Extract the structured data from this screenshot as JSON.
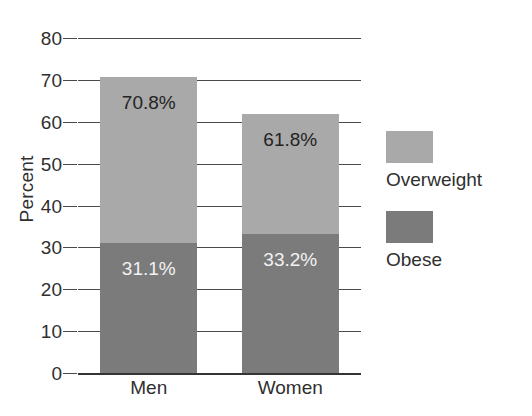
{
  "chart_data": {
    "type": "bar",
    "subtype": "stacked-bar",
    "title": "",
    "xlabel": "",
    "ylabel": "Percent",
    "ylim": [
      0,
      80
    ],
    "ytick_step": 10,
    "yticks": [
      80,
      70,
      60,
      50,
      40,
      30,
      20,
      10,
      0
    ],
    "ytick_labels": [
      "80",
      "70",
      "60",
      "50",
      "40",
      "30",
      "20",
      "10",
      "0"
    ],
    "categories": [
      "Men",
      "Women"
    ],
    "grid": "horizontal",
    "legend_position": "right",
    "series": [
      {
        "name": "Overweight",
        "color": "#a9a9a9",
        "note": "cumulative total including obese",
        "values": [
          70.8,
          61.8
        ],
        "labels": [
          "70.8%",
          "61.8%"
        ]
      },
      {
        "name": "Obese",
        "color": "#7b7b7b",
        "values": [
          31.1,
          33.2
        ],
        "labels": [
          "31.1%",
          "33.2%"
        ]
      }
    ]
  },
  "axes": {
    "y_title": "Percent"
  },
  "legend": {
    "items": [
      {
        "label": "Overweight",
        "color": "#a9a9a9",
        "swatch_name": "legend-swatch-overweight"
      },
      {
        "label": "Obese",
        "color": "#7b7b7b",
        "swatch_name": "legend-swatch-obese"
      }
    ]
  }
}
